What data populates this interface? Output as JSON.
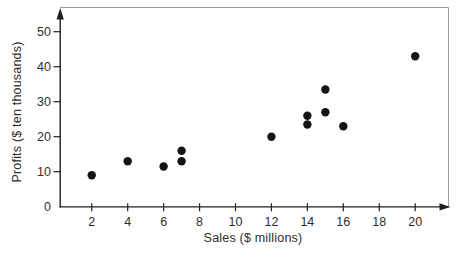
{
  "style": {
    "background": "#ffffff",
    "axis_color": "#1f1f1f",
    "frame_color": "#9c9c9c",
    "point_color": "#141414",
    "text_color": "#2d2d2d"
  },
  "chart_data": {
    "type": "scatter",
    "title": "",
    "xlabel": "Sales ($ millions)",
    "ylabel": "Profits ($ ten thousands)",
    "x_ticks": [
      2,
      4,
      6,
      8,
      10,
      12,
      14,
      16,
      18,
      20
    ],
    "y_ticks": [
      0,
      10,
      20,
      30,
      40,
      50
    ],
    "xlim": [
      0,
      21.5
    ],
    "ylim": [
      0,
      55
    ],
    "grid": false,
    "legend": false,
    "marker": "filled-circle",
    "points": [
      {
        "x": 2,
        "y": 9
      },
      {
        "x": 4,
        "y": 13
      },
      {
        "x": 6,
        "y": 11.5
      },
      {
        "x": 7,
        "y": 16
      },
      {
        "x": 7,
        "y": 13
      },
      {
        "x": 12,
        "y": 20
      },
      {
        "x": 14,
        "y": 26
      },
      {
        "x": 14,
        "y": 23.5
      },
      {
        "x": 15,
        "y": 33.5
      },
      {
        "x": 15,
        "y": 27
      },
      {
        "x": 16,
        "y": 23
      },
      {
        "x": 20,
        "y": 43
      }
    ]
  }
}
